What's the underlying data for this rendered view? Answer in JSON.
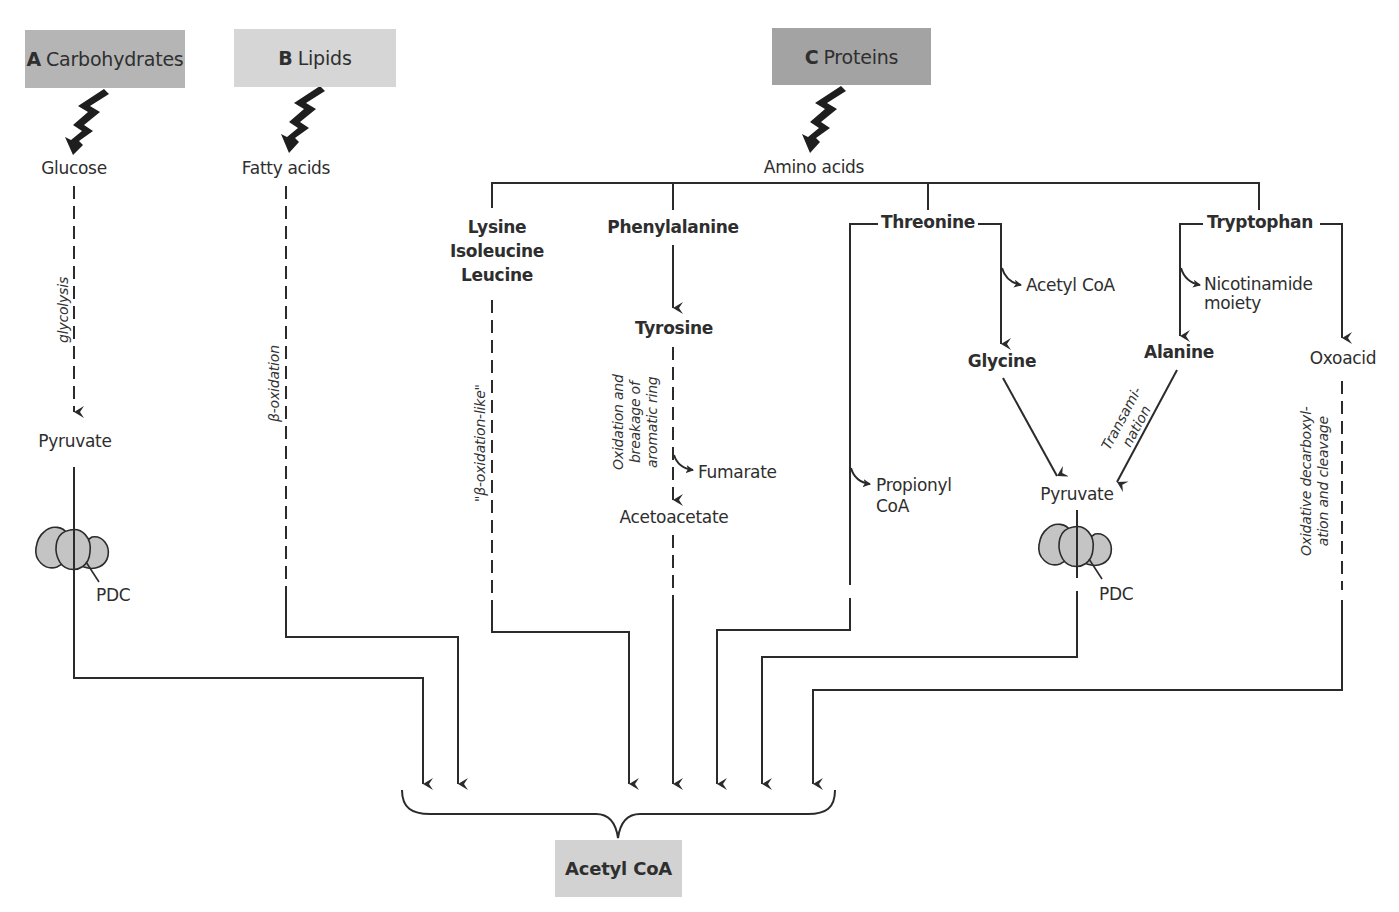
{
  "diagram": {
    "type": "metabolic-pathway",
    "sources": {
      "carbohydrates": {
        "letter": "A",
        "label": "Carbohydrates",
        "fill": "#b5b5b5"
      },
      "lipids": {
        "letter": "B",
        "label": "Lipids",
        "fill": "#d6d6d6"
      },
      "proteins": {
        "letter": "C",
        "label": "Proteins",
        "fill": "#a3a3a3"
      }
    },
    "target": {
      "label": "Acetyl CoA",
      "fill": "#d2d2d2"
    },
    "monomers": {
      "glucose": "Glucose",
      "fatty_acids": "Fatty acids",
      "amino_acids": "Amino acids"
    },
    "carbohydrate_path": {
      "process": "glycolysis",
      "intermediate": "Pyruvate",
      "enzyme": "PDC"
    },
    "lipid_path": {
      "process": "β-oxidation"
    },
    "amino_acid_groups": {
      "group1": {
        "line1": "Lysine",
        "line2": "Isoleucine",
        "line3": "Leucine",
        "process": "\"β-oxidation-like\""
      },
      "phenylalanine": {
        "label": "Phenylalanine",
        "product": "Tyrosine",
        "process_line1": "Oxidation and",
        "process_line2": "breakage of",
        "process_line3": "aromatic ring",
        "side_product": "Fumarate",
        "end_product": "Acetoacetate"
      },
      "threonine": {
        "label": "Threonine",
        "side_product": "Acetyl CoA",
        "product": "Glycine",
        "left_product_line1": "Propionyl",
        "left_product_line2": "CoA"
      },
      "tryptophan": {
        "label": "Tryptophan",
        "side_product_line1": "Nicotinamide",
        "side_product_line2": "moiety",
        "product": "Alanine",
        "right_product": "Oxoacid",
        "right_process_line1": "Oxidative decarboxyl-",
        "right_process_line2": "ation and cleavage"
      },
      "convergence": {
        "transamination_line1": "Transami-",
        "transamination_line2": "nation",
        "intermediate": "Pyruvate",
        "enzyme": "PDC"
      }
    },
    "line_color": "#2b2b2b",
    "pdc_fill": "#c4c4c4"
  }
}
